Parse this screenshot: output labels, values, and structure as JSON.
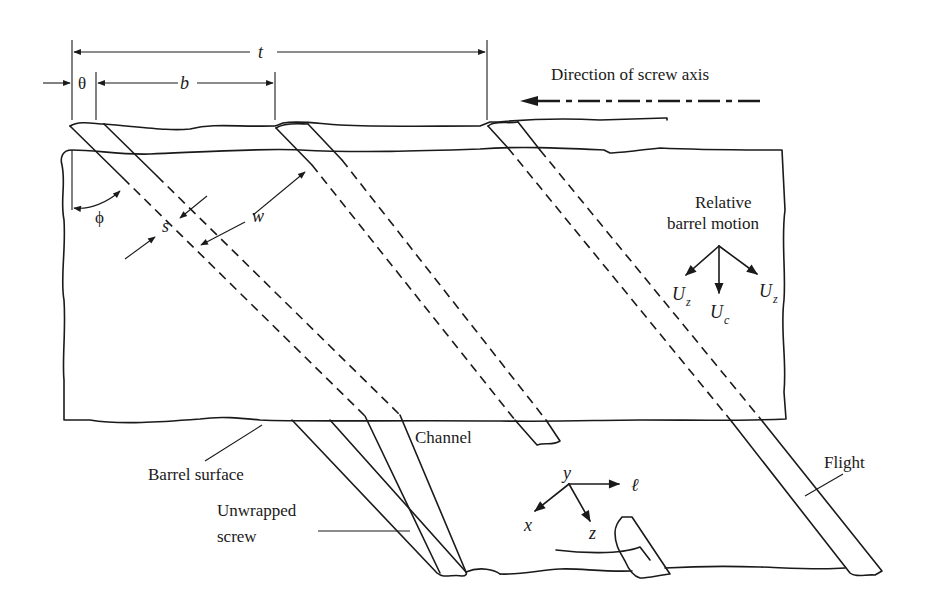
{
  "figure": {
    "dimensions": {
      "pitch_label": "t",
      "channel_width_axial_label": "b",
      "flight_width_axial_label": "θ",
      "helix_angle_label": "ϕ",
      "flight_width_label": "s",
      "channel_width_label": "w"
    },
    "direction": {
      "label": "Direction of screw axis"
    },
    "motion": {
      "label_line1": "Relative",
      "label_line2": "barrel motion",
      "components": [
        {
          "symbol": "U",
          "subscript": "z",
          "position": "left"
        },
        {
          "symbol": "U",
          "subscript": "c",
          "position": "center"
        },
        {
          "symbol": "U",
          "subscript": "z",
          "position": "right"
        }
      ]
    },
    "coordinates": {
      "x": "x",
      "y": "y",
      "z": "z",
      "l": "ℓ"
    },
    "callouts": {
      "channel": "Channel",
      "barrel_surface": "Barrel surface",
      "unwrapped_screw_line1": "Unwrapped",
      "unwrapped_screw_line2": "screw",
      "flight": "Flight"
    }
  }
}
